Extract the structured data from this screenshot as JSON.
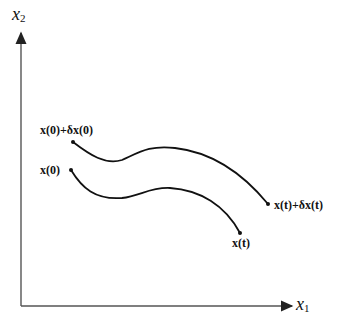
{
  "axes": {
    "x_label": "x",
    "x_sub": "1",
    "y_label": "x",
    "y_sub": "2"
  },
  "curves": [
    {
      "name": "perturbed-trajectory",
      "start_label": "x(0)+δx(0)",
      "end_label": "x(t)+δx(t)"
    },
    {
      "name": "nominal-trajectory",
      "start_label": "x(0)",
      "end_label": "x(t)"
    }
  ]
}
